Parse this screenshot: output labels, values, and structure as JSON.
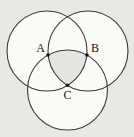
{
  "figure": {
    "kind": "three-circle-venn-diagram",
    "points": {
      "a": "A",
      "b": "B",
      "c": "C"
    },
    "colors": {
      "background": "#e9e8e4",
      "circle_fill": "#fafaf7",
      "circle_stroke": "#3c3c3c",
      "hatch_line": "#b5b5b5",
      "point_dot": "#111111",
      "label_text": "#141414"
    }
  }
}
